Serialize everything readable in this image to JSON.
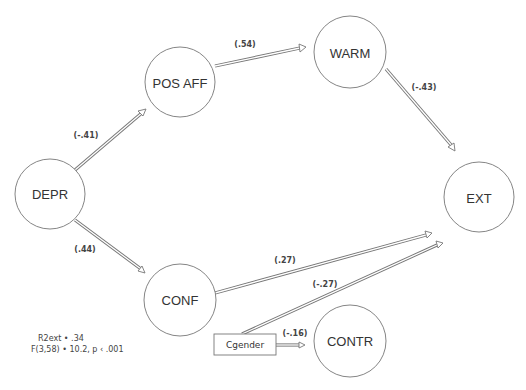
{
  "diagram": {
    "type": "path-model",
    "nodes": [
      {
        "id": "depr",
        "label": "DEPR",
        "shape": "circle",
        "cx": 50,
        "cy": 194,
        "r": 35
      },
      {
        "id": "posaff",
        "label": "POS AFF",
        "shape": "circle",
        "cx": 180,
        "cy": 82,
        "r": 35
      },
      {
        "id": "warm",
        "label": "WARM",
        "shape": "circle",
        "cx": 350,
        "cy": 52,
        "r": 36
      },
      {
        "id": "ext",
        "label": "EXT",
        "shape": "circle",
        "cx": 479,
        "cy": 197,
        "r": 35
      },
      {
        "id": "conf",
        "label": "CONF",
        "shape": "circle",
        "cx": 180,
        "cy": 300,
        "r": 36
      },
      {
        "id": "contr",
        "label": "CONTR",
        "shape": "circle",
        "cx": 350,
        "cy": 341,
        "r": 36
      },
      {
        "id": "cgender",
        "label": "Cgender",
        "shape": "box",
        "x": 214,
        "y": 334,
        "w": 62,
        "h": 21
      }
    ],
    "edges": [
      {
        "from": "DEPR",
        "to": "POS AFF",
        "coef": "(-.41)"
      },
      {
        "from": "POS AFF",
        "to": "WARM",
        "coef": "(.54)"
      },
      {
        "from": "WARM",
        "to": "EXT",
        "coef": "(-.43)"
      },
      {
        "from": "DEPR",
        "to": "CONF",
        "coef": "(.44)"
      },
      {
        "from": "CONF",
        "to": "EXT",
        "coef": "(.27)"
      },
      {
        "from": "Cgender",
        "to": "EXT",
        "coef": "(-.27)"
      },
      {
        "from": "Cgender",
        "to": "CONTR",
        "coef": "(-.16)"
      }
    ],
    "stats": {
      "line1": "R2ext • .34",
      "line2": "F(3,58) • 10.2, p ‹ .001"
    },
    "colors": {
      "stroke": "#777777",
      "text": "#333333",
      "background": "#ffffff"
    }
  }
}
